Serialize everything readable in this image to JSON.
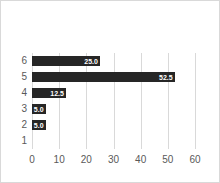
{
  "chart": {
    "title": "",
    "colors": {
      "bar": "#262626",
      "bar_label_text": "#ffffff",
      "axis_text": "#595959",
      "gridline": "#d9d9d9",
      "background": "#ffffff",
      "border": "#d9d9d9"
    }
  },
  "chart_data": {
    "type": "bar",
    "orientation": "horizontal",
    "title": "",
    "xlabel": "",
    "ylabel": "",
    "categories": [
      "6",
      "5",
      "4",
      "3",
      "2",
      "1"
    ],
    "values": [
      25.0,
      52.5,
      12.5,
      5.0,
      5.0,
      0
    ],
    "data_labels": [
      "25.0",
      "52.5",
      "12.5",
      "5.0",
      "5.0",
      ""
    ],
    "data_label_position": "inside-end",
    "x_ticks": [
      "0",
      "10",
      "20",
      "30",
      "40",
      "50",
      "60"
    ],
    "xlim": [
      0,
      60
    ],
    "grid": "vertical",
    "legend": "none"
  }
}
